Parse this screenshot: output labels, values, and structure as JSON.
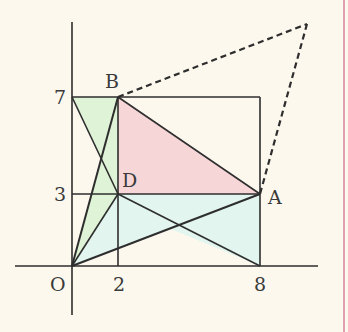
{
  "figure": {
    "background": "#fcf8ee",
    "border_color": "#e0a0b0",
    "line_color": "#2e2e2e",
    "fills": {
      "green": "#dff3d6",
      "pink": "#f7d6d8",
      "cyan": "#e2f5ef"
    },
    "points": {
      "O": {
        "label": "O",
        "x": 0,
        "y": 0
      },
      "A": {
        "label": "A",
        "x": 8,
        "y": 3
      },
      "B": {
        "label": "B",
        "x": 2,
        "y": 7
      },
      "D": {
        "label": "D",
        "x": 2,
        "y": 3
      }
    },
    "tick_labels": {
      "x2": "2",
      "x8": "8",
      "y3": "3",
      "y7": "7"
    }
  }
}
